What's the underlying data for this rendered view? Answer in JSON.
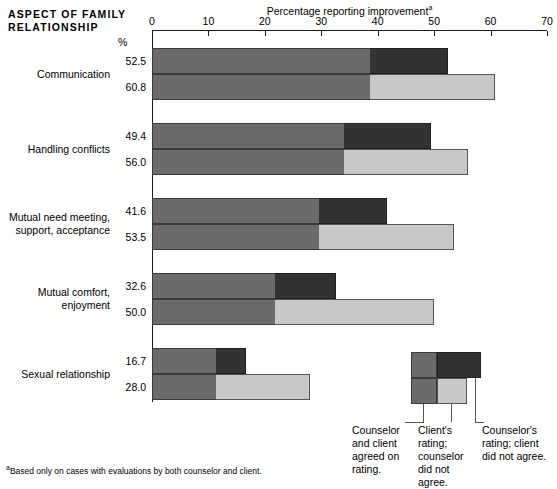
{
  "header": {
    "corner_title": "ASPECT OF FAMILY RELATIONSHIP",
    "axis_title": "Percentage reporting improvement",
    "axis_title_superscript": "a",
    "percent_symbol": "%"
  },
  "footnote": {
    "marker": "a",
    "text": "Based only on cases with evaluations by both counselor and client."
  },
  "legend": {
    "items": [
      {
        "key": "agreed",
        "label": "Counselor and client agreed on rating.",
        "color": "#6b6b6b"
      },
      {
        "key": "client_only",
        "label": "Client's rating; counselor did not agree.",
        "color": "#c8c8c8"
      },
      {
        "key": "counselor_only",
        "label": "Counselor's rating; client did not agree.",
        "color": "#333333"
      }
    ]
  },
  "chart_data": {
    "type": "bar",
    "orientation": "horizontal",
    "stacked": true,
    "title": "Percentage reporting improvement",
    "xlabel": "Percentage reporting improvement",
    "ylabel": "Aspect of family relationship",
    "xlim": [
      0,
      70
    ],
    "xticks": [
      0,
      10,
      20,
      30,
      40,
      50,
      60,
      70
    ],
    "grid": false,
    "legend_position": "bottom-right",
    "categories": [
      "Communication",
      "Handling conflicts",
      "Mutual need meeting, support, acceptance",
      "Mutual comfort, enjoyment",
      "Sexual relationship"
    ],
    "series": [
      {
        "name": "Counselor's rating",
        "values": [
          52.5,
          49.4,
          41.6,
          32.6,
          16.7
        ]
      },
      {
        "name": "Client's rating",
        "values": [
          60.8,
          56.0,
          53.5,
          50.0,
          28.0
        ]
      }
    ],
    "agreed_values": [
      38.6,
      34.0,
      29.6,
      21.8,
      11.3
    ],
    "groups": [
      {
        "category": "Communication",
        "category_lines": [
          "Communication"
        ],
        "counselor_total": 52.5,
        "client_total": 60.8,
        "agreed": 38.6,
        "counselor_label": "52.5",
        "client_label": "60.8"
      },
      {
        "category": "Handling conflicts",
        "category_lines": [
          "Handling conflicts"
        ],
        "counselor_total": 49.4,
        "client_total": 56.0,
        "agreed": 34.0,
        "counselor_label": "49.4",
        "client_label": "56.0"
      },
      {
        "category": "Mutual need meeting, support, acceptance",
        "category_lines": [
          "Mutual need meeting,",
          "support, acceptance"
        ],
        "counselor_total": 41.6,
        "client_total": 53.5,
        "agreed": 29.6,
        "counselor_label": "41.6",
        "client_label": "53.5"
      },
      {
        "category": "Mutual comfort, enjoyment",
        "category_lines": [
          "Mutual comfort,",
          "enjoyment"
        ],
        "counselor_total": 32.6,
        "client_total": 50.0,
        "agreed": 21.8,
        "counselor_label": "32.6",
        "client_label": "50.0"
      },
      {
        "category": "Sexual relationship",
        "category_lines": [
          "Sexual relationship"
        ],
        "counselor_total": 16.7,
        "client_total": 28.0,
        "agreed": 11.3,
        "counselor_label": "16.7",
        "client_label": "28.0"
      }
    ],
    "colors": {
      "agreed": "#6b6b6b",
      "counselor_only": "#333333",
      "client_only": "#c8c8c8",
      "axis": "#1a1a1a"
    }
  }
}
